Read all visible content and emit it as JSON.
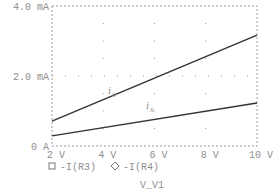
{
  "chart_data": {
    "type": "line",
    "title": "",
    "xlabel": "V_V1",
    "ylabel": "",
    "xlim": [
      2,
      10
    ],
    "ylim": [
      0,
      4.0
    ],
    "x_ticks": [
      "2 V",
      "4 V",
      "6 V",
      "8 V",
      "10 V"
    ],
    "y_ticks": [
      "0 A",
      "2.0 mA",
      "4.0 mA"
    ],
    "grid": "dotted",
    "legend_position": "bottom",
    "x": [
      2,
      10
    ],
    "series": [
      {
        "name": "-I(R3)",
        "marker": "square",
        "annotation": "i",
        "annotation_sub": "o",
        "values": [
          0.71,
          3.17
        ]
      },
      {
        "name": "-I(R4)",
        "marker": "diamond",
        "annotation": "i",
        "annotation_sub": "x",
        "values": [
          0.29,
          1.23
        ]
      }
    ]
  },
  "legend": {
    "items": [
      {
        "label": "-I(R3)",
        "icon": "square-icon"
      },
      {
        "label": "-I(R4)",
        "icon": "diamond-icon"
      }
    ]
  },
  "colors": {
    "axis": "#9a9a9a",
    "line": "#333333",
    "text": "#8f8f8f"
  }
}
